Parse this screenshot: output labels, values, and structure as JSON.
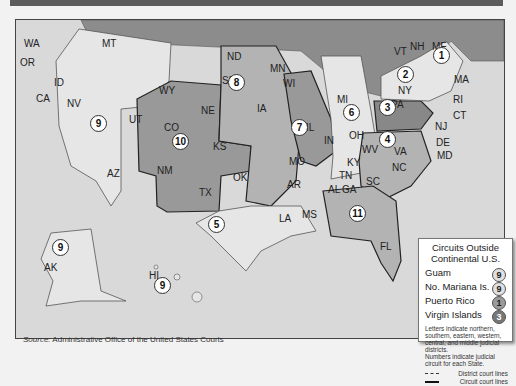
{
  "map": {
    "title": "U.S. Federal Judicial Circuits",
    "colors": {
      "background": "#d9d9d9",
      "canada": "#8c8c8c",
      "light_state": "#e6e6e6",
      "mid_state": "#b3b3b3",
      "dark_state": "#999999",
      "water": "#d9d9d9"
    },
    "states": [
      {
        "abbr": "WA",
        "x": 30,
        "y": 44
      },
      {
        "abbr": "OR",
        "x": 26,
        "y": 63
      },
      {
        "abbr": "CA",
        "x": 42,
        "y": 99
      },
      {
        "abbr": "NV",
        "x": 73,
        "y": 104
      },
      {
        "abbr": "ID",
        "x": 60,
        "y": 83
      },
      {
        "abbr": "MT",
        "x": 108,
        "y": 44
      },
      {
        "abbr": "WY",
        "x": 165,
        "y": 91
      },
      {
        "abbr": "UT",
        "x": 135,
        "y": 120
      },
      {
        "abbr": "CO",
        "x": 170,
        "y": 128
      },
      {
        "abbr": "AZ",
        "x": 113,
        "y": 174
      },
      {
        "abbr": "NM",
        "x": 163,
        "y": 171
      },
      {
        "abbr": "ND",
        "x": 233,
        "y": 57
      },
      {
        "abbr": "SD",
        "x": 228,
        "y": 81
      },
      {
        "abbr": "NE",
        "x": 207,
        "y": 111
      },
      {
        "abbr": "KS",
        "x": 219,
        "y": 147
      },
      {
        "abbr": "OK",
        "x": 239,
        "y": 178
      },
      {
        "abbr": "TX",
        "x": 205,
        "y": 193
      },
      {
        "abbr": "MN",
        "x": 276,
        "y": 69
      },
      {
        "abbr": "IA",
        "x": 263,
        "y": 109
      },
      {
        "abbr": "MO",
        "x": 295,
        "y": 162
      },
      {
        "abbr": "AR",
        "x": 293,
        "y": 185
      },
      {
        "abbr": "LA",
        "x": 285,
        "y": 219
      },
      {
        "abbr": "WI",
        "x": 289,
        "y": 84
      },
      {
        "abbr": "IL",
        "x": 312,
        "y": 128
      },
      {
        "abbr": "IN",
        "x": 330,
        "y": 141
      },
      {
        "abbr": "MI",
        "x": 343,
        "y": 100
      },
      {
        "abbr": "OH",
        "x": 355,
        "y": 136
      },
      {
        "abbr": "KY",
        "x": 353,
        "y": 163
      },
      {
        "abbr": "TN",
        "x": 345,
        "y": 176
      },
      {
        "abbr": "MS",
        "x": 308,
        "y": 215
      },
      {
        "abbr": "AL",
        "x": 334,
        "y": 190
      },
      {
        "abbr": "GA",
        "x": 348,
        "y": 190
      },
      {
        "abbr": "FL",
        "x": 386,
        "y": 247
      },
      {
        "abbr": "SC",
        "x": 372,
        "y": 182
      },
      {
        "abbr": "NC",
        "x": 398,
        "y": 168
      },
      {
        "abbr": "VA",
        "x": 400,
        "y": 152
      },
      {
        "abbr": "WV",
        "x": 368,
        "y": 150
      },
      {
        "abbr": "PA",
        "x": 397,
        "y": 105
      },
      {
        "abbr": "NY",
        "x": 404,
        "y": 91
      },
      {
        "abbr": "VT",
        "x": 400,
        "y": 52
      },
      {
        "abbr": "NH",
        "x": 416,
        "y": 47
      },
      {
        "abbr": "ME",
        "x": 438,
        "y": 47
      },
      {
        "abbr": "MA",
        "x": 460,
        "y": 80
      },
      {
        "abbr": "RI",
        "x": 459,
        "y": 100
      },
      {
        "abbr": "CT",
        "x": 459,
        "y": 116
      },
      {
        "abbr": "NJ",
        "x": 441,
        "y": 127
      },
      {
        "abbr": "DE",
        "x": 442,
        "y": 143
      },
      {
        "abbr": "MD",
        "x": 443,
        "y": 156
      },
      {
        "abbr": "AK",
        "x": 50,
        "y": 268
      },
      {
        "abbr": "HI",
        "x": 155,
        "y": 276
      }
    ],
    "circuits": [
      {
        "num": "1",
        "x": 441,
        "y": 55
      },
      {
        "num": "2",
        "x": 405,
        "y": 74
      },
      {
        "num": "3",
        "x": 387,
        "y": 107
      },
      {
        "num": "4",
        "x": 387,
        "y": 139
      },
      {
        "num": "5",
        "x": 216,
        "y": 224
      },
      {
        "num": "6",
        "x": 351,
        "y": 112
      },
      {
        "num": "7",
        "x": 299,
        "y": 127
      },
      {
        "num": "8",
        "x": 236,
        "y": 82
      },
      {
        "num": "9",
        "x": 98,
        "y": 123
      },
      {
        "num": "10",
        "x": 180,
        "y": 141
      },
      {
        "num": "11",
        "x": 357,
        "y": 213
      },
      {
        "num": "9",
        "x": 60,
        "y": 247
      },
      {
        "num": "9",
        "x": 162,
        "y": 285
      }
    ]
  },
  "legend": {
    "title_line1": "Circuits Outside",
    "title_line2": "Continental U.S.",
    "rows": [
      {
        "label": "Guam",
        "circuit": "9",
        "fill": "#e0e0e0"
      },
      {
        "label": "No. Mariana Is.",
        "circuit": "9",
        "fill": "#e0e0e0"
      },
      {
        "label": "Puerto Rico",
        "circuit": "1",
        "fill": "#9a9a9a"
      },
      {
        "label": "Virgin Islands",
        "circuit": "3",
        "fill": "#777777"
      }
    ],
    "note1": "Letters indicate northern, southern, eastern, western, central, and middle judicial districts.",
    "note2": "Numbers indicate judicial circuit for each State.",
    "district_lines": "District court lines",
    "circuit_lines": "Circuit court lines"
  },
  "source": {
    "prefix": "Source:",
    "text": " Administrative Office of the United States Courts"
  }
}
